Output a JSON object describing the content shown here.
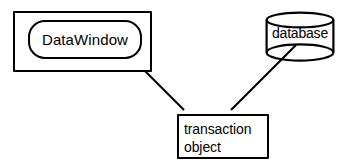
{
  "diagram": {
    "type": "relationship-diagram",
    "background_color": "#ffffff",
    "stroke_color": "#000000",
    "nodes": [
      {
        "id": "window_frame",
        "shape": "rectangle",
        "label": ""
      },
      {
        "id": "datawindow",
        "shape": "rounded-rectangle",
        "label": "DataWindow"
      },
      {
        "id": "database",
        "shape": "cylinder",
        "label": "database"
      },
      {
        "id": "transaction_object",
        "shape": "rectangle",
        "label_line_1": "transaction",
        "label_line_2": "object"
      }
    ],
    "connectors": [
      {
        "id": "datawindow-to-transaction",
        "from": "datawindow",
        "to": "transaction_object",
        "style": "solid-line"
      },
      {
        "id": "transaction-to-database",
        "from": "transaction_object",
        "to": "database",
        "style": "solid-line"
      }
    ]
  },
  "labels": {
    "datawindow": "DataWindow",
    "database": "database",
    "transaction_line1": "transaction",
    "transaction_line2": "object"
  }
}
